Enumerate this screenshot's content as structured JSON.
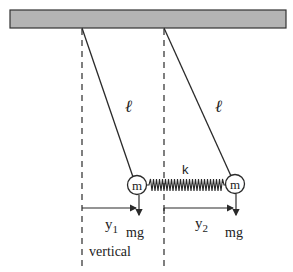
{
  "diagram": {
    "colors": {
      "ceiling_fill": "#b4b4b4",
      "ceiling_stroke": "#333333",
      "line": "#2a2a2a"
    },
    "labels": {
      "length_left": "ℓ",
      "length_right": "ℓ",
      "spring_constant": "k",
      "mass_left": "m",
      "mass_right": "m",
      "weight_left": "mg",
      "weight_right": "mg",
      "displacement_left": "y",
      "displacement_left_sub": "1",
      "displacement_right": "y",
      "displacement_right_sub": "2",
      "vertical": "vertical"
    }
  }
}
